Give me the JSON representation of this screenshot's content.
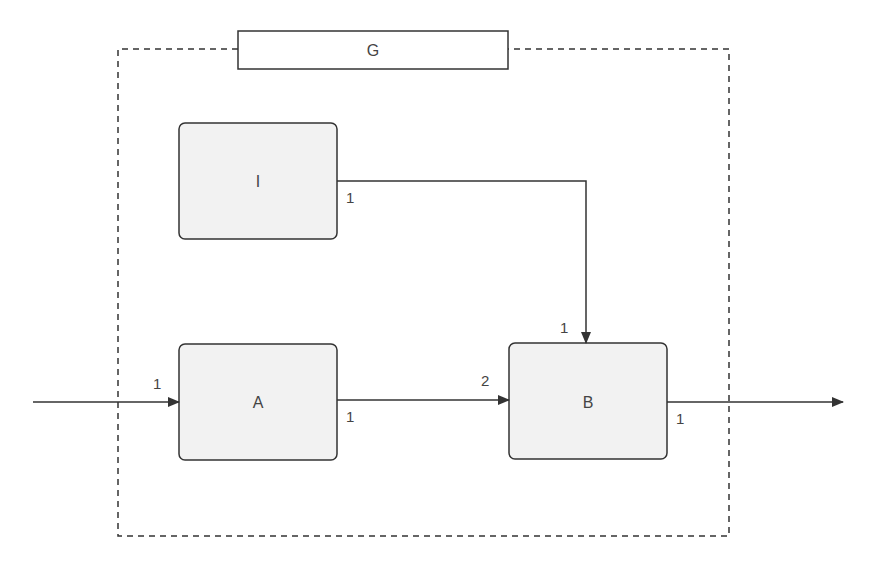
{
  "diagram": {
    "group": {
      "label": "G"
    },
    "blocks": [
      {
        "id": "I",
        "label": "I"
      },
      {
        "id": "A",
        "label": "A"
      },
      {
        "id": "B",
        "label": "B"
      }
    ],
    "ports": {
      "input_A": "1",
      "output_I": "1",
      "output_A": "1",
      "input_B_1": "1",
      "input_B_2": "2",
      "output_B": "1"
    },
    "colors": {
      "block_fill": "#f2f2f2",
      "stroke": "#333333",
      "text": "#444444"
    }
  }
}
